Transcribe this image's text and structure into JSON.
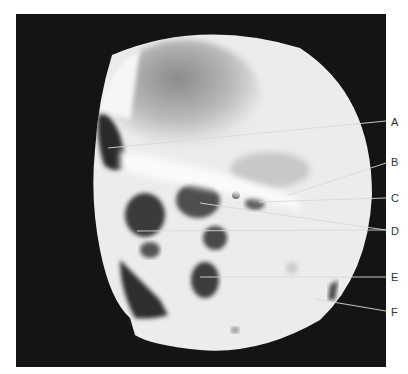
{
  "figure": {
    "type": "radiograph",
    "view": "lateral skull",
    "colors": {
      "background": "#ffffff",
      "frame": "#141414",
      "leader_line": "#d8d8d8",
      "label_text": "#333333"
    }
  },
  "labels": [
    {
      "id": "A",
      "text": "A",
      "x": 394,
      "y": 117
    },
    {
      "id": "B",
      "text": "B",
      "x": 394,
      "y": 157
    },
    {
      "id": "C",
      "text": "C",
      "x": 394,
      "y": 193
    },
    {
      "id": "D",
      "text": "D",
      "x": 394,
      "y": 226
    },
    {
      "id": "E",
      "text": "E",
      "x": 394,
      "y": 272
    },
    {
      "id": "F",
      "text": "F",
      "x": 394,
      "y": 307
    }
  ]
}
